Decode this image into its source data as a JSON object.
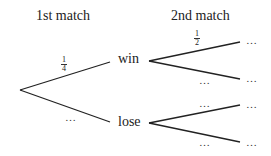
{
  "headers": {
    "first": "1st match",
    "second": "2nd match"
  },
  "nodes": {
    "win": "win",
    "lose": "lose"
  },
  "probabilities": {
    "first_win": {
      "num": "1",
      "den": "4"
    },
    "first_lose": "…",
    "win_win": {
      "num": "1",
      "den": "2"
    },
    "win_lose": "…",
    "lose_win": "…",
    "lose_lose": "…"
  },
  "outcomes": [
    "…",
    "…",
    "…",
    "…"
  ],
  "colors": {
    "line": "#222222",
    "text": "#222222"
  }
}
